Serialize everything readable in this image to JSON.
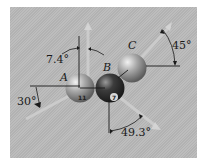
{
  "figure": {
    "background_color": "#b9b9b9",
    "balls": [
      {
        "label": "A",
        "number": "11",
        "color": "#a8a8a8"
      },
      {
        "label": "B",
        "number": "7",
        "color": "#3a3a3a"
      },
      {
        "label": "C",
        "number": "",
        "color": "#a8a8a8"
      }
    ],
    "angles": {
      "a_vertical": "7.4°",
      "a_horizontal": "30°",
      "b_vertical": "49.3°",
      "c_horizontal": "45°"
    }
  }
}
